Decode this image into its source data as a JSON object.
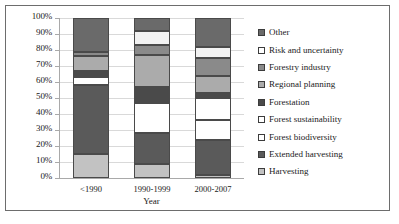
{
  "chart_data": {
    "type": "bar",
    "subtype": "stacked-100-percent",
    "title": "",
    "xlabel": "Year",
    "ylabel": "",
    "categories": [
      "<1990",
      "1990-1999",
      "2000-2007"
    ],
    "ylim": [
      0,
      100
    ],
    "ytick_labels": [
      "0%",
      "10%",
      "20%",
      "30%",
      "40%",
      "50%",
      "60%",
      "70%",
      "80%",
      "90%",
      "100%"
    ],
    "ytick_values": [
      0,
      10,
      20,
      30,
      40,
      50,
      60,
      70,
      80,
      90,
      100
    ],
    "grid": true,
    "legend_position": "right",
    "legend_order": [
      "Other",
      "Risk and uncertainty",
      "Forestry industry",
      "Regional planning",
      "Forestation",
      "Forest sustainability",
      "Forest biodiversity",
      "Extended harvesting",
      "Harvesting"
    ],
    "series": [
      {
        "name": "Harvesting",
        "color": "#c2c2c2",
        "values": [
          15,
          9,
          2
        ]
      },
      {
        "name": "Extended harvesting",
        "color": "#5a5a5a",
        "values": [
          43,
          19,
          22
        ]
      },
      {
        "name": "Forest biodiversity",
        "color": "#ffffff",
        "values": [
          5,
          19,
          12
        ]
      },
      {
        "name": "Forest sustainability",
        "color": "#ffffff",
        "values": [
          0,
          1,
          14
        ]
      },
      {
        "name": "Forestation",
        "color": "#4a4a4a",
        "values": [
          4,
          9,
          3
        ]
      },
      {
        "name": "Regional planning",
        "color": "#ababab",
        "values": [
          9,
          20,
          11
        ]
      },
      {
        "name": "Forestry industry",
        "color": "#8a8a8a",
        "values": [
          3,
          6,
          11
        ]
      },
      {
        "name": "Risk and uncertainty",
        "color": "#f2f2f2",
        "values": [
          0,
          9,
          7
        ]
      },
      {
        "name": "Other",
        "color": "#6a6a6a",
        "values": [
          21,
          8,
          18
        ]
      }
    ]
  },
  "legend": {
    "items": [
      {
        "label": "Other",
        "color": "#6a6a6a"
      },
      {
        "label": "Risk and uncertainty",
        "color": "#ffffff"
      },
      {
        "label": "Forestry industry",
        "color": "#8a8a8a"
      },
      {
        "label": "Regional planning",
        "color": "#ababab"
      },
      {
        "label": "Forestation",
        "color": "#4a4a4a"
      },
      {
        "label": "Forest sustainability",
        "color": "#ffffff"
      },
      {
        "label": "Forest biodiversity",
        "color": "#ffffff"
      },
      {
        "label": "Extended harvesting",
        "color": "#5a5a5a"
      },
      {
        "label": "Harvesting",
        "color": "#c2c2c2"
      }
    ]
  }
}
